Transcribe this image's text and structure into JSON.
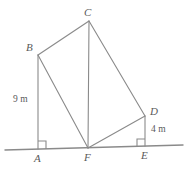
{
  "figure": {
    "stroke_color": "#8a8a8a",
    "text_color": "#5a5a5a",
    "background_color": "#ffffff",
    "vertices": [
      {
        "id": "A",
        "label": "A",
        "x": 38,
        "y": 149
      },
      {
        "id": "B",
        "label": "B",
        "x": 38,
        "y": 55
      },
      {
        "id": "C",
        "label": "C",
        "x": 89,
        "y": 21
      },
      {
        "id": "D",
        "label": "D",
        "x": 145,
        "y": 116
      },
      {
        "id": "E",
        "label": "E",
        "x": 145,
        "y": 146
      },
      {
        "id": "F",
        "label": "F",
        "x": 88,
        "y": 148
      }
    ],
    "ground_line": {
      "x1": 5,
      "y1": 150,
      "x2": 183,
      "y2": 145
    },
    "segments": [
      {
        "from": "A",
        "to": "B"
      },
      {
        "from": "B",
        "to": "C"
      },
      {
        "from": "C",
        "to": "D"
      },
      {
        "from": "D",
        "to": "E"
      },
      {
        "from": "B",
        "to": "F"
      },
      {
        "from": "C",
        "to": "F"
      },
      {
        "from": "D",
        "to": "F"
      }
    ],
    "right_angles": [
      {
        "at": "A",
        "note": "angle BAF is a right angle"
      },
      {
        "at": "E",
        "note": "angle DEF is a right angle"
      }
    ],
    "measures": [
      {
        "id": "AB",
        "text": "9 m",
        "value": 9,
        "unit": "m",
        "side": "left"
      },
      {
        "id": "DE",
        "text": "4 m",
        "value": 4,
        "unit": "m",
        "side": "right"
      }
    ]
  }
}
